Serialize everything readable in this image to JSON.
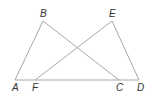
{
  "diagram": {
    "type": "geometry",
    "points": {
      "A": {
        "label": "A",
        "x": 15,
        "y": 80,
        "lx": 12,
        "ly": 91
      },
      "B": {
        "label": "B",
        "x": 43,
        "y": 21,
        "lx": 40,
        "ly": 17
      },
      "C": {
        "label": "C",
        "x": 119,
        "y": 80,
        "lx": 116,
        "ly": 91
      },
      "D": {
        "label": "D",
        "x": 139,
        "y": 80,
        "lx": 137,
        "ly": 91
      },
      "E": {
        "label": "E",
        "x": 112,
        "y": 21,
        "lx": 109,
        "ly": 17
      },
      "F": {
        "label": "F",
        "x": 35,
        "y": 80,
        "lx": 32,
        "ly": 91
      }
    },
    "segments": [
      {
        "from": "A",
        "to": "D"
      },
      {
        "from": "A",
        "to": "B"
      },
      {
        "from": "B",
        "to": "C"
      },
      {
        "from": "F",
        "to": "E"
      },
      {
        "from": "E",
        "to": "D"
      }
    ],
    "line_color": "#a8a8a8",
    "label_color": "#333333"
  }
}
